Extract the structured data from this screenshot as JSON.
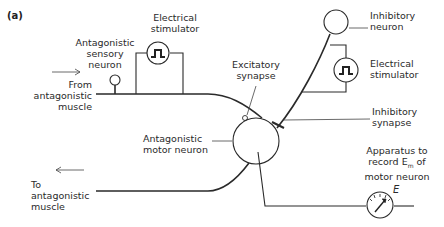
{
  "panel_label": "(a)",
  "labels": {
    "electrical_stimulator_left": [
      "Electrical",
      "stimulator"
    ],
    "antagonistic_sensory_neuron": [
      "Antagonistic",
      "sensory",
      "neuron"
    ],
    "from_antagonistic_muscle": [
      "From",
      "antagonistic",
      "muscle"
    ],
    "excitatory_synapse": [
      "Excitatory",
      "synapse"
    ],
    "inhibitory_neuron": [
      "Inhibitory",
      "neuron"
    ],
    "electrical_stimulator_right": [
      "Electrical",
      "stimulator"
    ],
    "inhibitory_synapse": [
      "Inhibitory",
      "synapse"
    ],
    "antagonistic_motor_neuron": [
      "Antagonistic",
      "motor neuron"
    ],
    "to_antagonistic_muscle": [
      "To",
      "antagonistic",
      "muscle"
    ],
    "apparatus": [
      "Apparatus to",
      "record E",
      "m",
      " of",
      "motor neuron"
    ],
    "meter_symbol": "E"
  }
}
